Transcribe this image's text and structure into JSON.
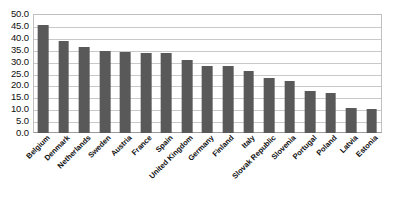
{
  "chart_data": {
    "type": "bar",
    "title": "",
    "subtitle": "",
    "xlabel": "",
    "ylabel": "",
    "ylim": [
      0,
      50
    ],
    "ytick_step": 5,
    "grid": true,
    "legend": false,
    "legend_position": "none",
    "bar_color": "#595959",
    "gridline_color": "#c9c9c9",
    "plot_border_color": "#bfbfbf",
    "categories": [
      "Belgium",
      "Denmark",
      "Netherlands",
      "Sweden",
      "Austria",
      "France",
      "Spain",
      "United Kingdom",
      "Germany",
      "Finland",
      "Italy",
      "Slovak Republic",
      "Slovenia",
      "Portugal",
      "Poland",
      "Latvia",
      "Estonia"
    ],
    "values": [
      45.5,
      38.5,
      36.0,
      34.5,
      34.0,
      33.8,
      33.5,
      30.5,
      28.0,
      28.0,
      26.0,
      23.0,
      22.0,
      17.5,
      17.0,
      10.5,
      10.0
    ],
    "ytick_labels": [
      "50.0",
      "45.0",
      "40.0",
      "35.0",
      "30.0",
      "25.0",
      "20.0",
      "15.0",
      "10.0",
      "5.0",
      "0.0"
    ],
    "ytick_values": [
      50.0,
      45.0,
      40.0,
      35.0,
      30.0,
      25.0,
      20.0,
      15.0,
      10.0,
      5.0,
      0.0
    ]
  }
}
